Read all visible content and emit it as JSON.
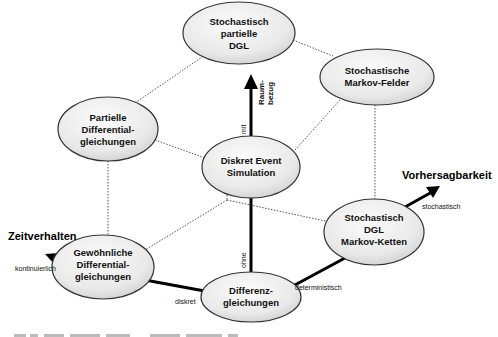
{
  "diagram": {
    "nodes": [
      {
        "id": "stoch-partielle-dgl",
        "lines": [
          "Stochastisch",
          "partielle",
          "DGL"
        ]
      },
      {
        "id": "stoch-markov-felder",
        "lines": [
          "Stochastische",
          "Markov-Felder"
        ]
      },
      {
        "id": "partielle-dgl",
        "lines": [
          "Partielle",
          "Differential-",
          "gleichungen"
        ]
      },
      {
        "id": "diskret-event",
        "lines": [
          "Diskret Event",
          "Simulation"
        ]
      },
      {
        "id": "stoch-markov-ketten",
        "lines": [
          "Stochastisch",
          "DGL",
          "Markov-Ketten"
        ]
      },
      {
        "id": "gewoehnliche-dgl",
        "lines": [
          "Gewöhnliche",
          "Differential-",
          "gleichungen"
        ]
      },
      {
        "id": "differenzgleichungen",
        "lines": [
          "Differenz-",
          "gleichungen"
        ]
      }
    ],
    "axes": {
      "raumbezug": {
        "title_lines": [
          "Raum-",
          "bezug"
        ],
        "label_with": "mit",
        "label_without": "ohne"
      },
      "zeitverhalten": {
        "title": "Zeitverhalten",
        "label_continuous": "kontinuierlich",
        "label_discrete": "diskret"
      },
      "vorhersagbarkeit": {
        "title": "Vorhersagbarkeit",
        "label_stochastic": "stochastisch",
        "label_deterministic": "deterministisch"
      }
    },
    "colors": {
      "node_fill_light": "#f7f7f7",
      "node_fill_dark": "#d6d6d6",
      "node_stroke": "#333333",
      "axis": "#000000",
      "dotted_edge": "#555555"
    }
  }
}
